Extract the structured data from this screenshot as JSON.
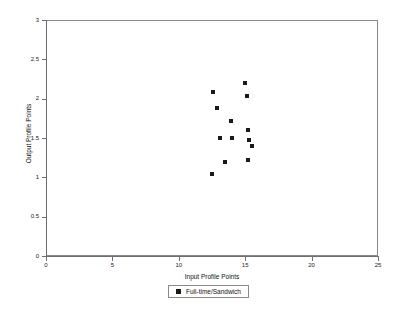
{
  "chart_data": {
    "type": "scatter",
    "title": "",
    "xlabel": "Input Profile Points",
    "ylabel": "Output Profile Points",
    "xlim": [
      0,
      25
    ],
    "ylim": [
      0,
      3
    ],
    "xticks": [
      0,
      5,
      10,
      15,
      20,
      25
    ],
    "yticks": [
      0,
      0.5,
      1,
      1.5,
      2,
      2.5,
      3
    ],
    "xtick_labels": [
      "0",
      "5",
      "10",
      "15",
      "20",
      "25"
    ],
    "ytick_labels": [
      "0",
      "0.5",
      "1",
      "1.5",
      "2",
      "2.5",
      "3"
    ],
    "grid": false,
    "legend_position": "below-center",
    "series": [
      {
        "name": "Full-time/Sandwich",
        "marker": "square",
        "color": "#1a1a1a",
        "points": [
          {
            "x": 12.6,
            "y": 2.08
          },
          {
            "x": 15.0,
            "y": 2.2
          },
          {
            "x": 15.1,
            "y": 2.03
          },
          {
            "x": 12.9,
            "y": 1.88
          },
          {
            "x": 13.9,
            "y": 1.72
          },
          {
            "x": 15.2,
            "y": 1.6
          },
          {
            "x": 13.1,
            "y": 1.5
          },
          {
            "x": 14.0,
            "y": 1.5
          },
          {
            "x": 15.3,
            "y": 1.48
          },
          {
            "x": 15.5,
            "y": 1.4
          },
          {
            "x": 15.2,
            "y": 1.22
          },
          {
            "x": 13.5,
            "y": 1.2
          },
          {
            "x": 12.5,
            "y": 1.04
          }
        ]
      }
    ]
  },
  "legend": {
    "entries": [
      {
        "label": "Full-time/Sandwich",
        "marker": "square-marker"
      }
    ]
  }
}
